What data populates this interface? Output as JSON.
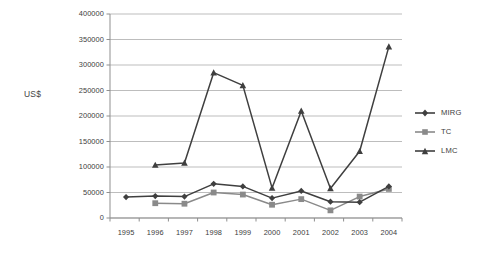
{
  "chart_data": {
    "type": "line",
    "title": "",
    "xlabel": "",
    "ylabel": "US$",
    "categories": [
      "1995",
      "1996",
      "1997",
      "1998",
      "1999",
      "2000",
      "2001",
      "2002",
      "2003",
      "2004"
    ],
    "ylim": [
      0,
      400000
    ],
    "yticks": [
      0,
      50000,
      100000,
      150000,
      200000,
      250000,
      300000,
      350000,
      400000
    ],
    "ytick_labels": [
      "0",
      "50000",
      "100000",
      "150000",
      "200000",
      "250000",
      "300000",
      "350000",
      "400000"
    ],
    "grid": "horizontal",
    "legend_position": "right",
    "series": [
      {
        "name": "MIRG",
        "marker": "diamond",
        "color": "#3f3f3f",
        "values": [
          41000,
          43000,
          42000,
          67000,
          62000,
          39000,
          53000,
          32000,
          31000,
          62000
        ]
      },
      {
        "name": "TC",
        "marker": "square",
        "color": "#8a8a8a",
        "values": [
          null,
          29000,
          28000,
          50000,
          46000,
          26000,
          37000,
          15000,
          42000,
          57000
        ]
      },
      {
        "name": "LMC",
        "marker": "triangle",
        "color": "#3f3f3f",
        "values": [
          null,
          104000,
          108000,
          285000,
          260000,
          59000,
          210000,
          58000,
          131000,
          336000
        ]
      }
    ]
  },
  "colors": {
    "gridline": "#b5b5b5",
    "axis": "#8f8f8f",
    "background": "#ffffff",
    "text": "#3d3d3d",
    "mirg": "#3f3f3f",
    "tc": "#8a8a8a",
    "lmc": "#3f3f3f"
  },
  "legend": {
    "items": [
      {
        "label": "MIRG"
      },
      {
        "label": "TC"
      },
      {
        "label": "LMC"
      }
    ]
  }
}
